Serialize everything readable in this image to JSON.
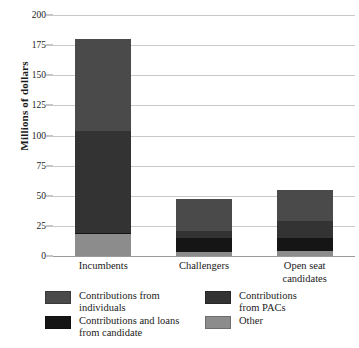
{
  "chart_data": {
    "type": "bar",
    "subtype": "stacked-vertical",
    "title": "",
    "xlabel": "",
    "ylabel": "Millions of dollars",
    "ylim": [
      0,
      200
    ],
    "yticks": [
      0,
      25,
      50,
      75,
      100,
      125,
      150,
      175,
      200
    ],
    "ytick_labels": [
      "0",
      "25",
      "50",
      "75",
      "100",
      "125",
      "150",
      "175",
      "200"
    ],
    "grid": "horizontal",
    "legend_position": "bottom",
    "categories": [
      "Incumbents",
      "Challengers",
      "Open seat candidates"
    ],
    "category_label_lines": [
      [
        "Incumbents"
      ],
      [
        "Challengers"
      ],
      [
        "Open seat",
        "candidates"
      ]
    ],
    "series": [
      {
        "name": "Other",
        "color": "#8c8c8c",
        "values": [
          18,
          3,
          4
        ],
        "stack_order": 0
      },
      {
        "name": "Contributions and loans from candidate",
        "color": "#151515",
        "values": [
          1,
          12,
          11
        ],
        "stack_order": 1
      },
      {
        "name": "Contributions from PACs",
        "color": "#333333",
        "values": [
          85,
          6,
          14
        ],
        "stack_order": 2
      },
      {
        "name": "Contributions from individuals",
        "color": "#4a4a4a",
        "values": [
          76,
          26,
          26
        ],
        "stack_order": 3
      }
    ],
    "totals": [
      180,
      47,
      55
    ]
  },
  "legend": {
    "entries": [
      {
        "label": "Contributions from\nindividuals",
        "color": "#4a4a4a",
        "name": "individuals"
      },
      {
        "label": "Contributions\nfrom PACs",
        "color": "#333333",
        "name": "pacs"
      },
      {
        "label": "Contributions and loans\nfrom candidate",
        "color": "#151515",
        "name": "candidate"
      },
      {
        "label": "Other",
        "color": "#8c8c8c",
        "name": "other"
      }
    ]
  },
  "axis": {
    "y_title": "Millions of dollars"
  },
  "colors": {
    "background": "#ffffff",
    "gridline": "#c9c9c9",
    "baseline": "#9a9a9a",
    "text": "#1a1a1a"
  }
}
